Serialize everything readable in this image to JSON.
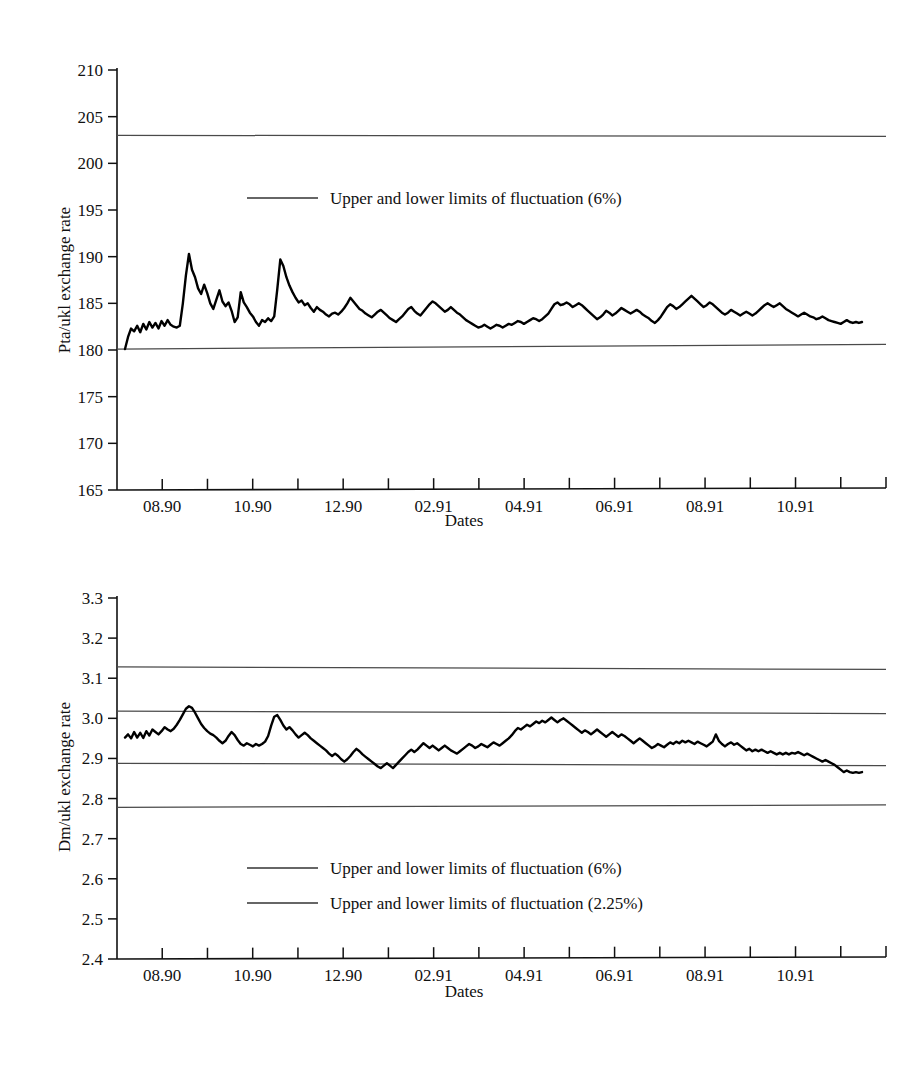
{
  "figures": [
    {
      "id": "pta-ukl",
      "ylabel": "Pta/ukl exchange rate",
      "xlabel": "Dates",
      "yticks": [
        "165",
        "170",
        "175",
        "180",
        "185",
        "190",
        "195",
        "200",
        "205",
        "210"
      ],
      "xticks": [
        "08.90",
        "10.90",
        "12.90",
        "02.91",
        "04.91",
        "06.91",
        "08.91",
        "10.91"
      ],
      "legend": [
        {
          "label": "Upper and lower limits of fluctuation (6%)"
        }
      ]
    },
    {
      "id": "dm-ukl",
      "ylabel": "Dm/ukl exchange rate",
      "xlabel": "Dates",
      "yticks": [
        "2.4",
        "2.5",
        "2.6",
        "2.7",
        "2.8",
        "2.9",
        "3.0",
        "3.1",
        "3.2",
        "3.3"
      ],
      "xticks": [
        "08.90",
        "10.90",
        "12.90",
        "02.91",
        "04.91",
        "06.91",
        "08.91",
        "10.91"
      ],
      "legend": [
        {
          "label": "Upper and lower limits of fluctuation (6%)"
        },
        {
          "label": "Upper and lower limits of fluctuation (2.25%)"
        }
      ]
    }
  ],
  "chart_data": [
    {
      "type": "line",
      "title": "",
      "xlabel": "Dates",
      "ylabel": "Pta/ukl exchange rate",
      "ylim": [
        165,
        210
      ],
      "ytick_values": [
        165,
        170,
        175,
        180,
        185,
        190,
        195,
        200,
        205,
        210
      ],
      "xtick_labels": [
        "08.90",
        "10.90",
        "12.90",
        "02.91",
        "04.91",
        "06.91",
        "08.91",
        "10.91"
      ],
      "xtick_count_minor": 17,
      "grid": false,
      "legend_position": "inside-upper-center",
      "annotations": [
        {
          "text": "Upper and lower limits of fluctuation (6%)",
          "value_upper": 203.0,
          "value_lower": 180.1
        }
      ],
      "reference_lines": [
        {
          "name": "upper-limit-6pct",
          "y_start": 203.0,
          "y_end": 202.9
        },
        {
          "name": "lower-limit-6pct",
          "y_start": 180.1,
          "y_end": 180.6
        }
      ],
      "series": [
        {
          "name": "Pta/ukl exchange rate",
          "x_start": "08.90",
          "x_end": "12.91",
          "values": [
            180.1,
            181.4,
            182.3,
            182.0,
            182.6,
            181.9,
            182.8,
            182.2,
            183.0,
            182.4,
            182.9,
            182.3,
            183.1,
            182.6,
            183.2,
            182.7,
            182.5,
            182.4,
            182.6,
            185.0,
            188.0,
            190.3,
            188.6,
            187.8,
            186.6,
            186.0,
            187.0,
            186.1,
            185.0,
            184.4,
            185.4,
            186.4,
            185.2,
            184.7,
            185.1,
            184.2,
            183.0,
            183.5,
            186.2,
            185.1,
            184.6,
            184.0,
            183.6,
            183.0,
            182.6,
            183.2,
            183.0,
            183.4,
            183.1,
            183.6,
            186.5,
            189.7,
            189.0,
            187.8,
            186.9,
            186.2,
            185.6,
            185.1,
            185.3,
            184.8,
            185.0,
            184.5,
            184.1,
            184.6,
            184.3,
            184.1,
            183.8,
            183.6,
            183.9,
            184.0,
            183.8,
            184.1,
            184.5,
            185.0,
            185.6,
            185.2,
            184.8,
            184.4,
            184.2,
            183.9,
            183.7,
            183.5,
            183.8,
            184.1,
            184.3,
            184.0,
            183.7,
            183.4,
            183.2,
            183.0,
            183.3,
            183.6,
            184.0,
            184.4,
            184.6,
            184.2,
            183.9,
            183.7,
            184.1,
            184.5,
            184.9,
            185.2,
            185.0,
            184.7,
            184.4,
            184.1,
            184.3,
            184.6,
            184.3,
            184.0,
            183.8,
            183.5,
            183.2,
            183.0,
            182.8,
            182.6,
            182.4,
            182.5,
            182.7,
            182.5,
            182.3,
            182.5,
            182.7,
            182.6,
            182.4,
            182.6,
            182.8,
            182.7,
            182.9,
            183.1,
            183.0,
            182.8,
            183.0,
            183.2,
            183.4,
            183.3,
            183.1,
            183.3,
            183.6,
            183.9,
            184.4,
            184.9,
            185.1,
            184.8,
            184.9,
            185.1,
            184.9,
            184.6,
            184.8,
            185.0,
            184.8,
            184.5,
            184.2,
            183.9,
            183.6,
            183.3,
            183.5,
            183.8,
            184.2,
            184.0,
            183.7,
            183.9,
            184.2,
            184.5,
            184.3,
            184.1,
            183.9,
            184.1,
            184.3,
            184.1,
            183.8,
            183.6,
            183.4,
            183.1,
            182.9,
            183.2,
            183.6,
            184.1,
            184.6,
            184.9,
            184.7,
            184.4,
            184.6,
            184.9,
            185.2,
            185.5,
            185.8,
            185.5,
            185.2,
            184.9,
            184.6,
            184.8,
            185.1,
            184.9,
            184.6,
            184.3,
            184.0,
            183.8,
            184.0,
            184.3,
            184.1,
            183.9,
            183.7,
            183.9,
            184.1,
            183.9,
            183.7,
            183.9,
            184.2,
            184.5,
            184.8,
            185.0,
            184.8,
            184.6,
            184.8,
            185.0,
            184.7,
            184.4,
            184.2,
            184.0,
            183.8,
            183.6,
            183.8,
            184.0,
            183.8,
            183.6,
            183.5,
            183.3,
            183.4,
            183.6,
            183.4,
            183.2,
            183.1,
            183.0,
            182.9,
            182.8,
            183.0,
            183.2,
            183.0,
            182.9,
            183.0,
            182.9,
            183.0
          ]
        }
      ]
    },
    {
      "type": "line",
      "title": "",
      "xlabel": "Dates",
      "ylabel": "Dm/ukl exchange rate",
      "ylim": [
        2.4,
        3.3
      ],
      "ytick_values": [
        2.4,
        2.5,
        2.6,
        2.7,
        2.8,
        2.9,
        3.0,
        3.1,
        3.2,
        3.3
      ],
      "xtick_labels": [
        "08.90",
        "10.90",
        "12.90",
        "02.91",
        "04.91",
        "06.91",
        "08.91",
        "10.91"
      ],
      "xtick_count_minor": 17,
      "grid": false,
      "legend_position": "inside-lower-center",
      "annotations": [
        {
          "text": "Upper and lower limits of fluctuation (6%)",
          "value_upper": 3.125,
          "value_lower": 2.775
        },
        {
          "text": "Upper and lower limits of fluctuation (2.25%)",
          "value_upper": 3.015,
          "value_lower": 2.885
        }
      ],
      "reference_lines": [
        {
          "name": "upper-limit-6pct",
          "y_start": 3.128,
          "y_end": 3.122
        },
        {
          "name": "upper-limit-2p25pct",
          "y_start": 3.018,
          "y_end": 3.012
        },
        {
          "name": "lower-limit-2p25pct",
          "y_start": 2.888,
          "y_end": 2.882
        },
        {
          "name": "lower-limit-6pct",
          "y_start": 2.778,
          "y_end": 2.784
        }
      ],
      "series": [
        {
          "name": "Dm/ukl exchange rate",
          "x_start": "08.90",
          "x_end": "12.91",
          "values": [
            2.952,
            2.96,
            2.95,
            2.966,
            2.952,
            2.964,
            2.951,
            2.968,
            2.957,
            2.972,
            2.966,
            2.96,
            2.968,
            2.978,
            2.972,
            2.968,
            2.974,
            2.984,
            2.996,
            3.01,
            3.024,
            3.03,
            3.026,
            3.014,
            3.0,
            2.986,
            2.976,
            2.968,
            2.962,
            2.958,
            2.952,
            2.944,
            2.938,
            2.944,
            2.956,
            2.966,
            2.958,
            2.946,
            2.936,
            2.932,
            2.938,
            2.934,
            2.93,
            2.936,
            2.932,
            2.936,
            2.942,
            2.956,
            2.982,
            3.004,
            3.008,
            2.996,
            2.982,
            2.972,
            2.978,
            2.97,
            2.96,
            2.952,
            2.958,
            2.964,
            2.958,
            2.95,
            2.944,
            2.938,
            2.932,
            2.926,
            2.92,
            2.912,
            2.906,
            2.912,
            2.906,
            2.898,
            2.892,
            2.898,
            2.906,
            2.916,
            2.924,
            2.918,
            2.91,
            2.904,
            2.898,
            2.892,
            2.886,
            2.88,
            2.876,
            2.882,
            2.888,
            2.882,
            2.876,
            2.884,
            2.892,
            2.9,
            2.908,
            2.916,
            2.922,
            2.916,
            2.922,
            2.93,
            2.938,
            2.932,
            2.926,
            2.932,
            2.926,
            2.92,
            2.926,
            2.932,
            2.926,
            2.92,
            2.916,
            2.912,
            2.918,
            2.924,
            2.93,
            2.936,
            2.932,
            2.926,
            2.93,
            2.936,
            2.932,
            2.928,
            2.934,
            2.94,
            2.936,
            2.932,
            2.938,
            2.944,
            2.95,
            2.958,
            2.968,
            2.976,
            2.972,
            2.978,
            2.984,
            2.98,
            2.986,
            2.992,
            2.988,
            2.994,
            2.99,
            2.996,
            3.002,
            2.996,
            2.99,
            2.996,
            3.0,
            2.994,
            2.988,
            2.982,
            2.976,
            2.97,
            2.964,
            2.97,
            2.966,
            2.96,
            2.966,
            2.972,
            2.966,
            2.96,
            2.954,
            2.96,
            2.966,
            2.96,
            2.954,
            2.96,
            2.956,
            2.95,
            2.944,
            2.938,
            2.944,
            2.95,
            2.944,
            2.938,
            2.932,
            2.926,
            2.93,
            2.936,
            2.932,
            2.928,
            2.934,
            2.94,
            2.936,
            2.942,
            2.938,
            2.944,
            2.94,
            2.944,
            2.94,
            2.936,
            2.942,
            2.938,
            2.934,
            2.93,
            2.936,
            2.942,
            2.96,
            2.944,
            2.936,
            2.93,
            2.936,
            2.94,
            2.934,
            2.938,
            2.932,
            2.926,
            2.92,
            2.924,
            2.918,
            2.922,
            2.918,
            2.922,
            2.918,
            2.914,
            2.918,
            2.914,
            2.91,
            2.914,
            2.91,
            2.914,
            2.91,
            2.914,
            2.912,
            2.916,
            2.912,
            2.908,
            2.912,
            2.908,
            2.904,
            2.9,
            2.896,
            2.892,
            2.896,
            2.892,
            2.888,
            2.884,
            2.878,
            2.872,
            2.866,
            2.87,
            2.866,
            2.864,
            2.866,
            2.864,
            2.866
          ]
        }
      ]
    }
  ]
}
